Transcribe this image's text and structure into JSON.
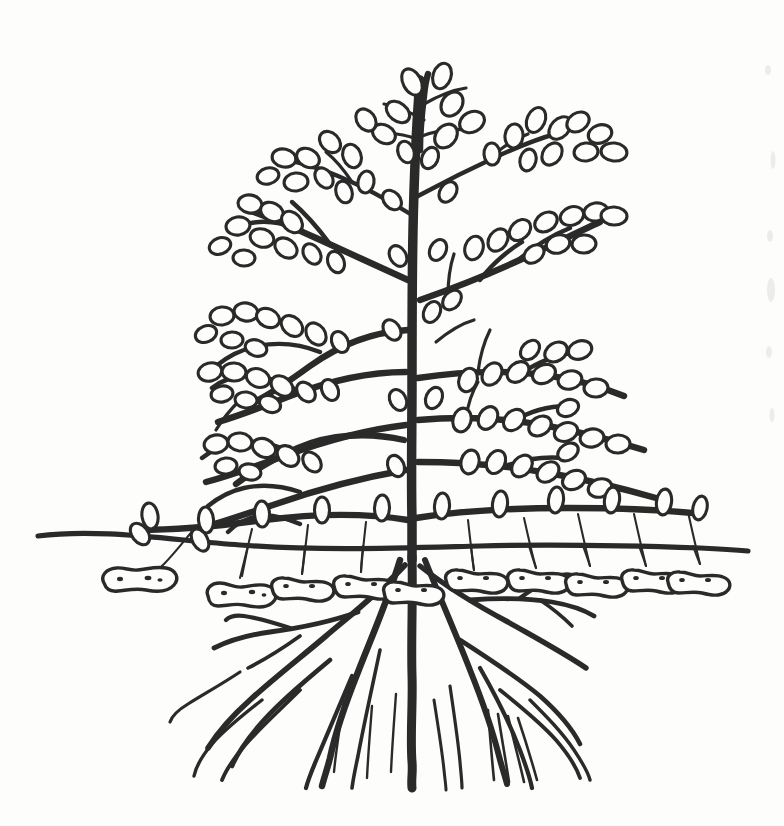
{
  "figure": {
    "title": "Peanut (groundnut) plant, whole-plant line drawing",
    "subject_common_name": "Peanut",
    "style": "hand-drawn ink line illustration",
    "background_color": "#fdfdfc",
    "ink_color": "#2a2a2a",
    "canvas": {
      "width": 784,
      "height": 826
    }
  },
  "scene": {
    "soil_line": {
      "label": "soil surface line",
      "y": 545,
      "x_start": 38,
      "x_end": 748,
      "stroke_color": "#2a2a2a",
      "stroke_width": 5.2
    },
    "regions": [
      {
        "name": "shoot-above-ground",
        "y_top": 58,
        "y_bottom": 545
      },
      {
        "name": "pod-zone-below-ground",
        "y_top": 545,
        "y_bottom": 620
      },
      {
        "name": "root-zone",
        "y_top": 560,
        "y_bottom": 795
      }
    ]
  },
  "plant": {
    "main_stem": {
      "label": "central erect stem",
      "x": 412,
      "y_top": 72,
      "y_bottom": 560,
      "stroke_width": 9.5
    },
    "branch_tiers": [
      {
        "tier": 1,
        "label": "apical cluster",
        "y": 100,
        "direction": "up"
      },
      {
        "tier": 2,
        "label": "upper left branch",
        "y": 185,
        "direction": "left"
      },
      {
        "tier": 3,
        "label": "upper right branch",
        "y": 150,
        "direction": "right"
      },
      {
        "tier": 4,
        "label": "mid right branch",
        "y": 255,
        "direction": "right"
      },
      {
        "tier": 5,
        "label": "mid left branch",
        "y": 300,
        "direction": "left"
      },
      {
        "tier": 6,
        "label": "lower right branch",
        "y": 345,
        "direction": "right"
      },
      {
        "tier": 7,
        "label": "lower left branch",
        "y": 400,
        "direction": "left"
      },
      {
        "tier": 8,
        "label": "basal right branch",
        "y": 420,
        "direction": "right"
      },
      {
        "tier": 9,
        "label": "basal left branch",
        "y": 450,
        "direction": "left"
      },
      {
        "tier": 10,
        "label": "ground-level left branch",
        "y": 515,
        "direction": "left"
      },
      {
        "tier": 11,
        "label": "ground-level right branch",
        "y": 510,
        "direction": "right"
      }
    ],
    "leaflet_count_estimate": 118,
    "leaflet_shape": "teardrop outline",
    "pegs": {
      "label": "gynophores (pegs) descending into soil",
      "count": 11
    },
    "pods": {
      "label": "developing peanut pods underground",
      "count": 11,
      "shape": "constricted two-lobed shell with pitted texture"
    },
    "roots": {
      "label": "taproot with lateral roots",
      "taproot_x": 412,
      "taproot_depth": 790,
      "lateral_count": 16
    }
  },
  "annotations": {
    "edge_marks": "faint scanner artifacts along right margin",
    "visible_text": []
  }
}
